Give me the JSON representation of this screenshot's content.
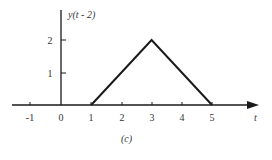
{
  "figure": {
    "caption": "(c)",
    "y_axis_label": "y(t - 2)",
    "x_axis_label": "t",
    "line_color": "#1a1a1a",
    "text_color": "#333333"
  },
  "axes": {
    "x_ticks": [
      {
        "value": -1,
        "label": "-1",
        "px": 30
      },
      {
        "value": 0,
        "label": "0",
        "px": 61
      },
      {
        "value": 1,
        "label": "1",
        "px": 91
      },
      {
        "value": 2,
        "label": "2",
        "px": 122
      },
      {
        "value": 3,
        "label": "3",
        "px": 152
      },
      {
        "value": 4,
        "label": "4",
        "px": 182
      },
      {
        "value": 5,
        "label": "5",
        "px": 212
      }
    ],
    "y_ticks": [
      {
        "value": 1,
        "label": "1",
        "py": 73
      },
      {
        "value": 2,
        "label": "2",
        "py": 40
      }
    ]
  },
  "chart_data": {
    "type": "line",
    "title": "",
    "xlabel": "t",
    "ylabel": "y(t - 2)",
    "caption": "(c)",
    "x": [
      1,
      3,
      5
    ],
    "y": [
      0,
      2,
      0
    ],
    "xlim": [
      -1.5,
      6.5
    ],
    "ylim": [
      0,
      2.5
    ],
    "x_tick_labels": [
      "-1",
      "0",
      "1",
      "2",
      "3",
      "4",
      "5"
    ],
    "y_tick_labels": [
      "1",
      "2"
    ],
    "grid": false,
    "legend": null
  }
}
